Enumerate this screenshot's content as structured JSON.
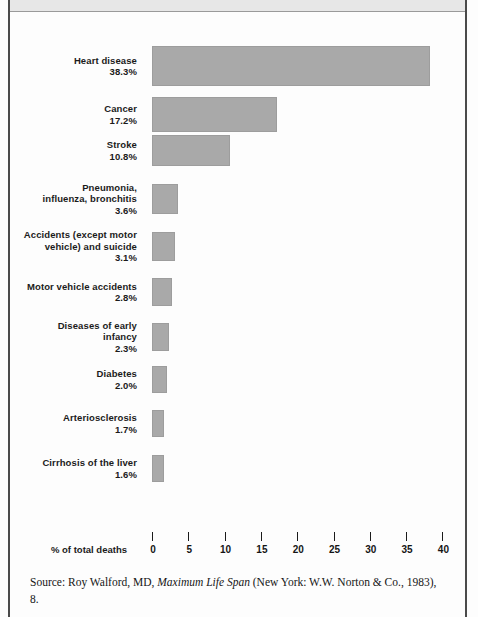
{
  "chart_data": {
    "type": "bar",
    "orientation": "horizontal",
    "title": "",
    "xlabel": "% of total deaths",
    "ylabel": "",
    "xlim": [
      0,
      40
    ],
    "xticks": [
      "0",
      "5",
      "10",
      "15",
      "20",
      "25",
      "30",
      "35",
      "40"
    ],
    "grid": false,
    "legend": "none",
    "bar_color": "#a9a9a9",
    "categories": [
      "Heart disease",
      "Cancer",
      "Stroke",
      "Pneumonia,\ninfluenza, bronchitis",
      "Accidents (except motor\nvehicle) and suicide",
      "Motor vehicle accidents",
      "Diseases of early\ninfancy",
      "Diabetes",
      "Arteriosclerosis",
      "Cirrhosis of the liver"
    ],
    "values": [
      38.3,
      17.2,
      10.8,
      3.6,
      3.1,
      2.8,
      2.3,
      2.0,
      1.7,
      1.6
    ],
    "value_labels": [
      "38.3%",
      "17.2%",
      "10.8%",
      "3.6%",
      "3.1%",
      "2.8%",
      "2.3%",
      "2.0%",
      "1.7%",
      "1.6%"
    ],
    "bars": [
      {
        "name": "Heart disease",
        "label_lines": [
          "Heart disease"
        ],
        "value": 38.3,
        "value_label": "38.3%"
      },
      {
        "name": "Cancer",
        "label_lines": [
          "Cancer"
        ],
        "value": 17.2,
        "value_label": "17.2%"
      },
      {
        "name": "Stroke",
        "label_lines": [
          "Stroke"
        ],
        "value": 10.8,
        "value_label": "10.8%"
      },
      {
        "name": "Pneumonia, influenza, bronchitis",
        "label_lines": [
          "Pneumonia,",
          "influenza, bronchitis"
        ],
        "value": 3.6,
        "value_label": "3.6%"
      },
      {
        "name": "Accidents (except motor vehicle) and suicide",
        "label_lines": [
          "Accidents (except motor",
          "vehicle) and suicide"
        ],
        "value": 3.1,
        "value_label": "3.1%"
      },
      {
        "name": "Motor vehicle accidents",
        "label_lines": [
          "Motor vehicle accidents"
        ],
        "value": 2.8,
        "value_label": "2.8%"
      },
      {
        "name": "Diseases of early infancy",
        "label_lines": [
          "Diseases of early",
          "infancy"
        ],
        "value": 2.3,
        "value_label": "2.3%"
      },
      {
        "name": "Diabetes",
        "label_lines": [
          "Diabetes"
        ],
        "value": 2.0,
        "value_label": "2.0%"
      },
      {
        "name": "Arteriosclerosis",
        "label_lines": [
          "Arteriosclerosis"
        ],
        "value": 1.7,
        "value_label": "1.7%"
      },
      {
        "name": "Cirrhosis of the liver",
        "label_lines": [
          "Cirrhosis of the liver"
        ],
        "value": 1.6,
        "value_label": "1.6%"
      }
    ]
  },
  "source": {
    "prefix": "Source: Roy Walford, MD, ",
    "italic_title": "Maximum Life Span",
    "suffix": " (New York: W.W. Norton & Co., 1983), 8."
  }
}
